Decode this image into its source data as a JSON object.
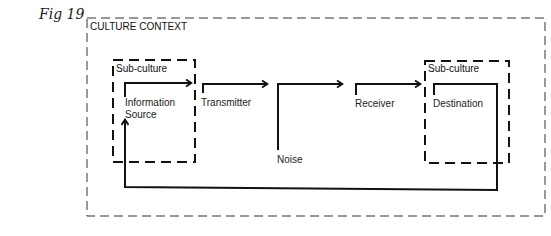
{
  "figure": {
    "label": "Fig 19"
  },
  "context_box": {
    "label": "CULTURE CONTEXT"
  },
  "subculture_left": {
    "label": "Sub-culture"
  },
  "subculture_right": {
    "label": "Sub-culture"
  },
  "nodes": {
    "information_source": [
      "Information",
      "Source"
    ],
    "transmitter": "Transmitter",
    "noise": "Noise",
    "receiver": "Receiver",
    "destination": "Destination"
  },
  "colors": {
    "line": "#111111",
    "dash": "#222222",
    "background": "#ffffff"
  }
}
